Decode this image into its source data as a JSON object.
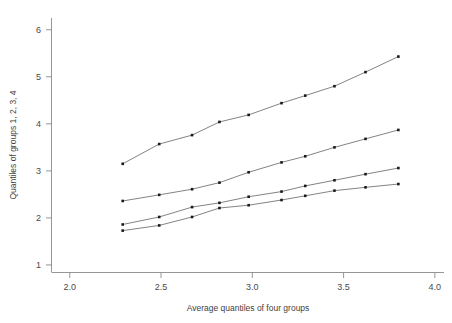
{
  "chart_data": {
    "type": "line",
    "title": "",
    "xlabel": "Average quantiles of four groups",
    "ylabel": "Quantiles of groups 1, 2, 3, 4",
    "xlim": [
      1.9,
      4.05
    ],
    "ylim": [
      0.85,
      6.25
    ],
    "xticks": [
      2.0,
      2.5,
      3.0,
      3.5,
      4.0
    ],
    "xtick_labels": [
      "2.0",
      "2.5",
      "3.0",
      "3.5",
      "4.0"
    ],
    "yticks": [
      1,
      2,
      3,
      4,
      5,
      6
    ],
    "ytick_labels": [
      "1",
      "2",
      "3",
      "4",
      "5",
      "6"
    ],
    "grid": false,
    "legend": "none",
    "marker": "filled-square",
    "x": [
      2.29,
      2.49,
      2.67,
      2.82,
      2.98,
      3.16,
      3.29,
      3.45,
      3.62,
      3.8
    ],
    "series": [
      {
        "name": "Group 1",
        "values": [
          3.15,
          3.57,
          3.76,
          4.04,
          4.19,
          4.44,
          4.6,
          4.8,
          5.1,
          5.43
        ]
      },
      {
        "name": "Group 2",
        "values": [
          2.36,
          2.49,
          2.61,
          2.75,
          2.97,
          3.18,
          3.31,
          3.5,
          3.68,
          3.87
        ]
      },
      {
        "name": "Group 3",
        "values": [
          1.86,
          2.02,
          2.23,
          2.32,
          2.45,
          2.56,
          2.68,
          2.8,
          2.93,
          3.06
        ]
      },
      {
        "name": "Group 4",
        "values": [
          1.73,
          1.84,
          2.02,
          2.21,
          2.27,
          2.38,
          2.47,
          2.58,
          2.65,
          2.72
        ]
      }
    ]
  }
}
